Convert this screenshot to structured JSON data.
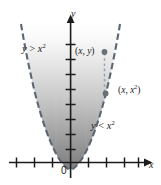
{
  "figure": {
    "name": "parabola-inequality-diagram",
    "background_color": "#ffffff"
  },
  "axes": {
    "x_axis": {
      "label": "x",
      "arrow": true,
      "tick_count_left": 3,
      "tick_count_right": 4,
      "color": "#1c1c1c"
    },
    "y_axis": {
      "label": "y",
      "arrow": true,
      "tick_count": 8,
      "color": "#1c1c1c"
    },
    "origin_label": "0"
  },
  "curve": {
    "name": "parabola",
    "equation_base": "y",
    "equation_rel": "=",
    "equation_expr": "x",
    "equation_exp": "2",
    "style": "dashed",
    "color": "#5a6270"
  },
  "region": {
    "shade_top_color": "#fdfdfd",
    "shade_bottom_color": "#7d7d7d",
    "label_above": {
      "var": "y",
      "rel": ">",
      "expr": "x",
      "exp": "2"
    },
    "label_below": {
      "var": "y",
      "rel": "<",
      "expr": "x",
      "exp": "2"
    }
  },
  "points": [
    {
      "id": "point-xy",
      "open_paren": "(",
      "x_text": "x",
      "comma": ", ",
      "y_text": "y",
      "close_paren": ")",
      "exp": "",
      "marker_color": "#6b7078"
    },
    {
      "id": "point-xx2",
      "open_paren": "(",
      "x_text": "x",
      "comma": ", ",
      "y_text": "x",
      "exp": "2",
      "close_paren": ")",
      "marker_color": "#6b7078"
    }
  ],
  "connector": {
    "name": "vertical-dashed-connector",
    "style": "dashed",
    "color": "#8d939b"
  }
}
